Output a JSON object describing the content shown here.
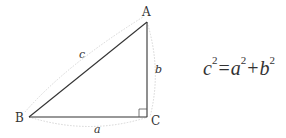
{
  "diagram": {
    "type": "right-triangle",
    "vertices": {
      "A": {
        "label": "A",
        "x": 147,
        "y": 22
      },
      "B": {
        "label": "B",
        "x": 29,
        "y": 117
      },
      "C": {
        "label": "C",
        "x": 148,
        "y": 117
      }
    },
    "sides": {
      "a": {
        "label": "a",
        "from": "B",
        "to": "C"
      },
      "b": {
        "label": "b",
        "from": "C",
        "to": "A"
      },
      "c": {
        "label": "c",
        "from": "B",
        "to": "A"
      }
    },
    "right_angle_at": "C",
    "colors": {
      "line": "#333333",
      "arc": "#d0d0d0",
      "text": "#333333"
    }
  },
  "equation": {
    "lhs_var": "c",
    "lhs_exp": "2",
    "equals": "=",
    "term1_var": "a",
    "term1_exp": "2",
    "plus": "+",
    "term2_var": "b",
    "term2_exp": "2"
  }
}
